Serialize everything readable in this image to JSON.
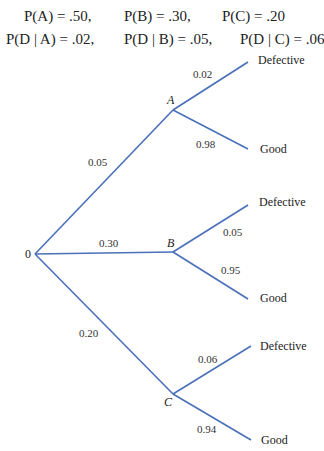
{
  "formulas": {
    "row1": [
      "P(A) = .50,",
      "P(B) = .30,",
      "P(C) = .20"
    ],
    "row2": [
      "P(D | A) = .02,",
      "P(D | B) = .05,",
      "P(D | C) = .06"
    ]
  },
  "tree": {
    "root_label": "0",
    "line_color": "#4a70b8",
    "branches": [
      {
        "node": "A",
        "prob": "0.05",
        "children": [
          {
            "label": "Defective",
            "prob": "0.02"
          },
          {
            "label": "Good",
            "prob": "0.98"
          }
        ]
      },
      {
        "node": "B",
        "prob": "0.30",
        "children": [
          {
            "label": "Defective",
            "prob": "0.05"
          },
          {
            "label": "Good",
            "prob": "0.95"
          }
        ]
      },
      {
        "node": "C",
        "prob": "0.20",
        "children": [
          {
            "label": "Defective",
            "prob": "0.06"
          },
          {
            "label": "Good",
            "prob": "0.94"
          }
        ]
      }
    ]
  }
}
